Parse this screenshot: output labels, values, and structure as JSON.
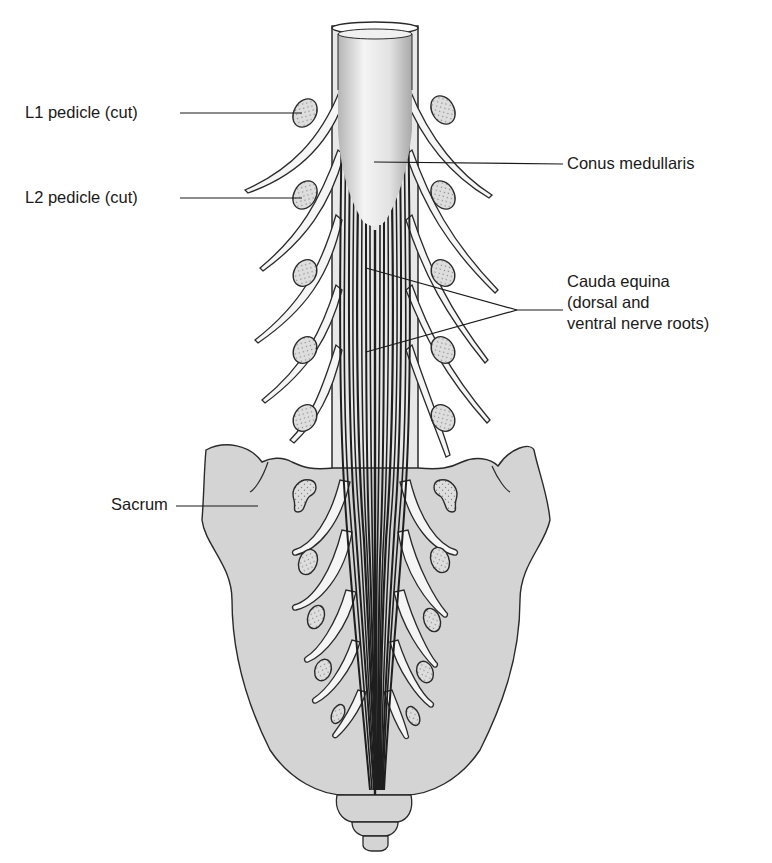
{
  "figure": {
    "colors": {
      "bone_fill": "#d4d4d4",
      "outline": "#2a2a2a",
      "cord_light": "#f2f2f2",
      "cord_shade": "#b8b8b8",
      "pedicle_fill": "#dcdcdc",
      "background": "#ffffff"
    }
  },
  "labels": {
    "l1_pedicle": "L1 pedicle (cut)",
    "l2_pedicle": "L2 pedicle (cut)",
    "conus_medullaris": "Conus medullaris",
    "cauda_equina": {
      "line1": "Cauda equina",
      "line2": "(dorsal and",
      "line3": "ventral nerve roots)"
    },
    "sacrum": "Sacrum"
  }
}
